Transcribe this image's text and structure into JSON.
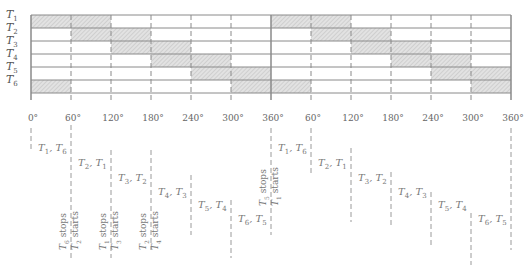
{
  "diagram": {
    "type": "switching-sequence-timing",
    "rows": [
      {
        "label": "T",
        "sub": "1",
        "on": [
          [
            0,
            120
          ],
          [
            360,
            480
          ]
        ]
      },
      {
        "label": "T",
        "sub": "2",
        "on": [
          [
            60,
            180
          ],
          [
            420,
            540
          ]
        ]
      },
      {
        "label": "T",
        "sub": "3",
        "on": [
          [
            120,
            240
          ],
          [
            480,
            600
          ]
        ]
      },
      {
        "label": "T",
        "sub": "4",
        "on": [
          [
            180,
            300
          ],
          [
            540,
            660
          ]
        ]
      },
      {
        "label": "T",
        "sub": "5",
        "on": [
          [
            240,
            360
          ],
          [
            600,
            720
          ]
        ]
      },
      {
        "label": "T",
        "sub": "6",
        "on": [
          [
            0,
            60
          ],
          [
            300,
            420
          ],
          [
            660,
            720
          ]
        ]
      }
    ],
    "axis_ticks": [
      "0°",
      "60°",
      "120°",
      "180°",
      "240°",
      "300°",
      "360°",
      "60°",
      "120°",
      "180°",
      "240°",
      "300°",
      "360°"
    ],
    "conduction_pairs": [
      {
        "a": "T",
        "as": "1",
        "b": "T",
        "bs": "6"
      },
      {
        "a": "T",
        "as": "2",
        "b": "T",
        "bs": "1"
      },
      {
        "a": "T",
        "as": "3",
        "b": "T",
        "bs": "2"
      },
      {
        "a": "T",
        "as": "4",
        "b": "T",
        "bs": "3"
      },
      {
        "a": "T",
        "as": "5",
        "b": "T",
        "bs": "4"
      },
      {
        "a": "T",
        "as": "6",
        "b": "T",
        "bs": "5"
      },
      {
        "a": "T",
        "as": "1",
        "b": "T",
        "bs": "6"
      },
      {
        "a": "T",
        "as": "2",
        "b": "T",
        "bs": "1"
      },
      {
        "a": "T",
        "as": "3",
        "b": "T",
        "bs": "2"
      },
      {
        "a": "T",
        "as": "4",
        "b": "T",
        "bs": "3"
      },
      {
        "a": "T",
        "as": "5",
        "b": "T",
        "bs": "4"
      },
      {
        "a": "T",
        "as": "6",
        "b": "T",
        "bs": "5"
      }
    ],
    "transitions": [
      {
        "stops": "6",
        "starts": "2",
        "stops_text": "stops",
        "starts_text": "starts"
      },
      {
        "stops": "1",
        "starts": "3",
        "stops_text": "stops",
        "starts_text": "starts"
      },
      {
        "stops": "2",
        "starts": "4",
        "stops_text": "stops",
        "starts_text": "starts"
      },
      {
        "stops": "5",
        "starts": "1",
        "stops_text": "stops",
        "starts_text": "starts"
      }
    ],
    "colors": {
      "grid": "#8a8a8a",
      "shade": "#d4d4d4",
      "text": "#6a6a6a"
    }
  }
}
